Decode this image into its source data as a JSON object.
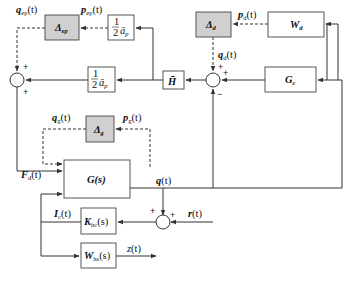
{
  "diagram": {
    "type": "control-block-diagram",
    "colors": {
      "line": "#333333",
      "uncertainty_fill": "#d0d0d0",
      "box_fill": "#ffffff",
      "background": "#ffffff"
    },
    "blocks": [
      {
        "id": "delta_ep",
        "label": "Δ",
        "sub": "ep",
        "uncertainty": true
      },
      {
        "id": "half_ap_top",
        "label": "½ā",
        "sub": "p",
        "uncertainty": false
      },
      {
        "id": "half_ap_low",
        "label": "½ā",
        "sub": "p",
        "uncertainty": false
      },
      {
        "id": "H_bar",
        "label": "H̄",
        "sub": "",
        "uncertainty": false
      },
      {
        "id": "delta_d",
        "label": "Δ",
        "sub": "d",
        "uncertainty": true
      },
      {
        "id": "W_d",
        "label": "W",
        "sub": "d",
        "uncertainty": false
      },
      {
        "id": "G_c",
        "label": "G",
        "sub": "c",
        "uncertainty": false
      },
      {
        "id": "delta_g",
        "label": "Δ",
        "sub": "g",
        "uncertainty": true
      },
      {
        "id": "G_s",
        "label": "G(s)",
        "sub": "",
        "uncertainty": false
      },
      {
        "id": "K_hc",
        "label": "K",
        "sub": "hc",
        "suffix": "(s)",
        "uncertainty": false
      },
      {
        "id": "W_hs",
        "label": "W",
        "sub": "hs",
        "suffix": "(s)",
        "uncertainty": false
      }
    ],
    "signals": {
      "q_ep": {
        "main": "q",
        "sub": "ep",
        "arg": "(t)"
      },
      "p_ep": {
        "main": "p",
        "sub": "ep",
        "arg": "(t)"
      },
      "p_d": {
        "main": "p",
        "sub": "d",
        "arg": "(t)"
      },
      "q_d": {
        "main": "q",
        "sub": "d",
        "arg": "(t)"
      },
      "q_g": {
        "main": "q",
        "sub": "g",
        "arg": "(t)"
      },
      "p_g": {
        "main": "p",
        "sub": "g",
        "arg": "(t)"
      },
      "F_d": {
        "main": "F",
        "sub": "d",
        "arg": "(t)"
      },
      "q": {
        "main": "q",
        "sub": "",
        "arg": "(t)"
      },
      "I_c": {
        "main": "I",
        "sub": "c",
        "arg": "(t)"
      },
      "r": {
        "main": "r",
        "sub": "",
        "arg": "(t)"
      },
      "z": {
        "main": "z",
        "sub": "",
        "arg": "(t)"
      }
    },
    "summing_junctions": [
      {
        "id": "sum_left",
        "signs": [
          "+",
          "+"
        ]
      },
      {
        "id": "sum_right",
        "signs": [
          "+",
          "+",
          "−"
        ]
      },
      {
        "id": "sum_bottom",
        "signs": [
          "+",
          "+"
        ]
      }
    ]
  }
}
